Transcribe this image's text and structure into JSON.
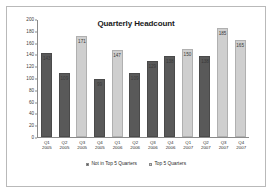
{
  "chart_data": {
    "type": "bar",
    "title": "Quarterly Headcount",
    "xlabel": "",
    "ylabel": "",
    "ylim": [
      0,
      200
    ],
    "yticks": [
      0,
      20,
      40,
      60,
      80,
      100,
      120,
      140,
      160,
      180,
      200
    ],
    "grid": false,
    "legend_position": "bottom",
    "categories": [
      "Q1 2005",
      "Q2 2005",
      "Q3 2005",
      "Q4 2005",
      "Q1 2006",
      "Q2 2006",
      "Q3 2006",
      "Q4 2006",
      "Q1 2007",
      "Q2 2007",
      "Q3 2007",
      "Q4 2007"
    ],
    "category_lines": [
      {
        "quarter": "Q1",
        "year": "2005"
      },
      {
        "quarter": "Q2",
        "year": "2005"
      },
      {
        "quarter": "Q3",
        "year": "2005"
      },
      {
        "quarter": "Q4",
        "year": "2005"
      },
      {
        "quarter": "Q1",
        "year": "2006"
      },
      {
        "quarter": "Q2",
        "year": "2006"
      },
      {
        "quarter": "Q3",
        "year": "2006"
      },
      {
        "quarter": "Q4",
        "year": "2006"
      },
      {
        "quarter": "Q1",
        "year": "2007"
      },
      {
        "quarter": "Q2",
        "year": "2007"
      },
      {
        "quarter": "Q3",
        "year": "2007"
      },
      {
        "quarter": "Q4",
        "year": "2007"
      }
    ],
    "values": [
      143,
      109,
      171,
      99,
      147,
      109,
      129,
      138,
      150,
      138,
      185,
      165
    ],
    "bars": [
      {
        "category": "Q1 2005",
        "value": 143,
        "label": "143",
        "series": "Not in Top 5 Quarters",
        "color": "#595959",
        "label_inside": true
      },
      {
        "category": "Q2 2005",
        "value": 109,
        "label": "109",
        "series": "Not in Top 5 Quarters",
        "color": "#595959",
        "label_inside": true
      },
      {
        "category": "Q3 2005",
        "value": 171,
        "label": "171",
        "series": "Top 5 Quarters",
        "color": "#cfcfcf",
        "label_inside": true
      },
      {
        "category": "Q4 2005",
        "value": 99,
        "label": "99",
        "series": "Not in Top 5 Quarters",
        "color": "#595959",
        "label_inside": true
      },
      {
        "category": "Q1 2006",
        "value": 147,
        "label": "147",
        "series": "Top 5 Quarters",
        "color": "#cfcfcf",
        "label_inside": true
      },
      {
        "category": "Q2 2006",
        "value": 109,
        "label": "109",
        "series": "Not in Top 5 Quarters",
        "color": "#595959",
        "label_inside": true
      },
      {
        "category": "Q3 2006",
        "value": 129,
        "label": "129",
        "series": "Not in Top 5 Quarters",
        "color": "#595959",
        "label_inside": true
      },
      {
        "category": "Q4 2006",
        "value": 138,
        "label": "138",
        "series": "Not in Top 5 Quarters",
        "color": "#595959",
        "label_inside": true
      },
      {
        "category": "Q1 2007",
        "value": 150,
        "label": "150",
        "series": "Top 5 Quarters",
        "color": "#cfcfcf",
        "label_inside": true
      },
      {
        "category": "Q2 2007",
        "value": 138,
        "label": "138",
        "series": "Not in Top 5 Quarters",
        "color": "#595959",
        "label_inside": true
      },
      {
        "category": "Q3 2007",
        "value": 185,
        "label": "185",
        "series": "Top 5 Quarters",
        "color": "#cfcfcf",
        "label_inside": true
      },
      {
        "category": "Q4 2007",
        "value": 165,
        "label": "165",
        "series": "Top 5 Quarters",
        "color": "#cfcfcf",
        "label_inside": true
      }
    ],
    "series": [
      {
        "name": "Not in Top 5 Quarters",
        "color": "#595959"
      },
      {
        "name": "Top 5 Quarters",
        "color": "#cfcfcf"
      }
    ]
  },
  "legend": {
    "items": [
      {
        "label": "Not in Top 5 Quarters",
        "color": "#595959"
      },
      {
        "label": "Top 5 Quarters",
        "color": "#cfcfcf"
      }
    ]
  },
  "colors": {
    "frame_border": "#b9b9b9",
    "axis": "#8a8a8a",
    "dark_bar": "#595959",
    "light_bar": "#cfcfcf",
    "text": "#2b2b2b",
    "background": "#ffffff"
  }
}
